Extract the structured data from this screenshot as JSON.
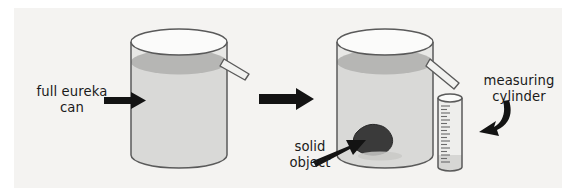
{
  "figure": {
    "background_color": "#ffffff",
    "plate_color": "#f4f3f1",
    "outline_color": "#4a4a4a",
    "ink_color": "#1a1a1a",
    "water_fill_color": "#d8d8d6",
    "water_surface_color": "#b4b4b2",
    "glass_fill_color": "#e6e6e4",
    "solid_object_color": "#3b3b3b"
  },
  "labels": {
    "eureka_can": "full eureka\ncan",
    "solid_object": "solid\nobject",
    "measuring_cylinder": "measuring\ncylinder"
  },
  "stages": {
    "before": {
      "name": "full eureka can",
      "has_object": false,
      "spout_flowing": false,
      "water_level": "full to spout"
    },
    "after": {
      "name": "eureka can with solid object",
      "has_object": true,
      "spout_flowing": true,
      "water_level": "full to spout",
      "collected_volume": "displaced water in measuring cylinder"
    }
  },
  "measuring_cylinder": {
    "graduation_count": 22,
    "water_level_fraction": 0.18
  },
  "arrows": {
    "transition": "right",
    "eureka_pointer": "right",
    "solid_pointer": "up-right",
    "cylinder_pointer": "curved-down-left"
  }
}
